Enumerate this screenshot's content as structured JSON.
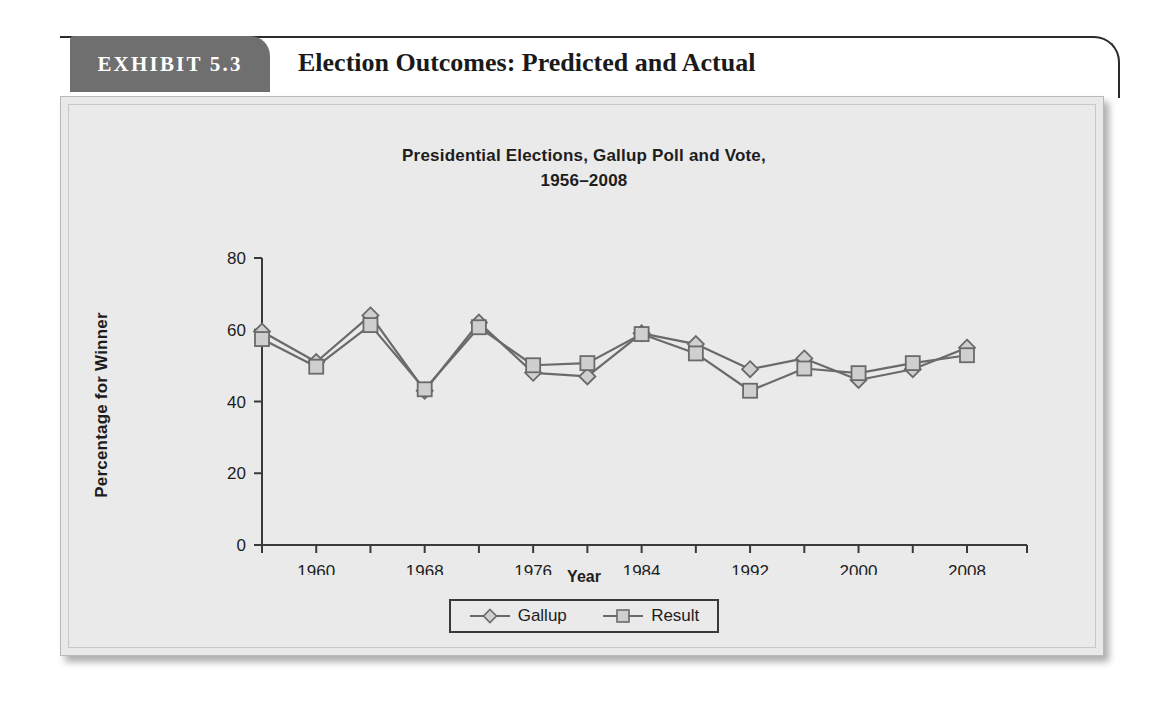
{
  "exhibit": {
    "tab_label": "EXHIBIT 5.3",
    "title": "Election Outcomes: Predicted and Actual",
    "tab_color": "#6f6f6f",
    "panel_color": "#e9e9e9"
  },
  "legend": {
    "gallup_label": "Gallup",
    "result_label": "Result",
    "gallup_marker": "diamond-marker-icon",
    "result_marker": "square-marker-icon"
  },
  "chart_data": {
    "type": "line",
    "title": "Presidential Elections, Gallup Poll and Vote,",
    "title_line2": "1956–2008",
    "xlabel": "Year",
    "ylabel": "Percentage for Winner",
    "xlim": [
      1956,
      2008
    ],
    "ylim": [
      0,
      80
    ],
    "yticks": [
      0,
      20,
      40,
      60,
      80
    ],
    "ytick_labels": [
      "0",
      "20",
      "40",
      "60",
      "80"
    ],
    "xticks": [
      1956,
      1960,
      1964,
      1968,
      1972,
      1976,
      1980,
      1984,
      1988,
      1992,
      1996,
      2000,
      2004,
      2008
    ],
    "xtick_labels_shown": [
      "1960",
      "1968",
      "1976",
      "1984",
      "1992",
      "2000",
      "2008"
    ],
    "xtick_labels_shown_years": [
      1960,
      1968,
      1976,
      1984,
      1992,
      2000,
      2008
    ],
    "grid": false,
    "legend_position": "bottom-center",
    "x": [
      1956,
      1960,
      1964,
      1968,
      1972,
      1976,
      1980,
      1984,
      1988,
      1992,
      1996,
      2000,
      2004,
      2008
    ],
    "series": [
      {
        "name": "Gallup",
        "marker": "diamond",
        "values": [
          59.5,
          51.0,
          64.0,
          43.0,
          62.0,
          48.0,
          47.0,
          59.0,
          56.0,
          49.0,
          52.0,
          46.0,
          49.0,
          55.0
        ]
      },
      {
        "name": "Result",
        "marker": "square",
        "values": [
          57.4,
          49.7,
          61.3,
          43.4,
          60.7,
          50.1,
          50.7,
          58.8,
          53.4,
          43.0,
          49.2,
          47.9,
          50.7,
          52.9
        ]
      }
    ],
    "line_color": "#6a6a6a",
    "marker_fill": "#cfcfcf",
    "marker_stroke": "#6a6a6a"
  }
}
